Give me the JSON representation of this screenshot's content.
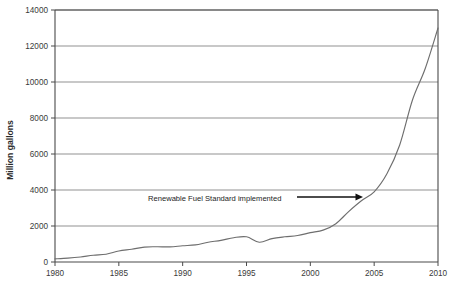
{
  "chart_data": {
    "type": "line",
    "title": "",
    "xlabel": "",
    "ylabel": "Million gallons",
    "xlim": [
      1980,
      2010
    ],
    "ylim": [
      0,
      14000
    ],
    "grid": true,
    "legend": "none",
    "x_ticks": [
      "1980",
      "1985",
      "1990",
      "1995",
      "2000",
      "2005",
      "2010"
    ],
    "x_tick_values": [
      1980,
      1985,
      1990,
      1995,
      2000,
      2005,
      2010
    ],
    "y_ticks": [
      "0",
      "2000",
      "4000",
      "6000",
      "8000",
      "10000",
      "12000",
      "14000"
    ],
    "y_tick_values": [
      0,
      2000,
      4000,
      6000,
      8000,
      10000,
      12000,
      14000
    ],
    "series": [
      {
        "name": "Ethanol production",
        "x": [
          1980,
          1981,
          1982,
          1983,
          1984,
          1985,
          1986,
          1987,
          1988,
          1989,
          1990,
          1991,
          1992,
          1993,
          1994,
          1995,
          1996,
          1997,
          1998,
          1999,
          2000,
          2001,
          2002,
          2003,
          2004,
          2005,
          2006,
          2007,
          2008,
          2009,
          2010
        ],
        "values": [
          175,
          215,
          280,
          375,
          430,
          610,
          710,
          830,
          845,
          840,
          900,
          950,
          1100,
          1200,
          1350,
          1400,
          1100,
          1300,
          1400,
          1470,
          1630,
          1770,
          2130,
          2800,
          3400,
          3900,
          4900,
          6500,
          9000,
          10750,
          13000
        ]
      }
    ],
    "annotations": [
      {
        "label": "Renewable Fuel Standard implemented",
        "text_x": 148,
        "text_y": 201,
        "arrow_from_x": 297,
        "arrow_from_y": 197,
        "arrow_to_x": 363,
        "arrow_to_y": 197,
        "points_at_year": 2005,
        "points_at_value": 3900
      }
    ],
    "colors": {
      "background": "#ffffff",
      "curve": "#6e6e6e",
      "grid": "#7d7d7d",
      "axis": "#4a4a4a",
      "annotation": "#111111",
      "text": "#3a3a3a"
    },
    "plot_area": {
      "left": 55,
      "right": 438,
      "top": 10,
      "bottom": 262
    }
  }
}
